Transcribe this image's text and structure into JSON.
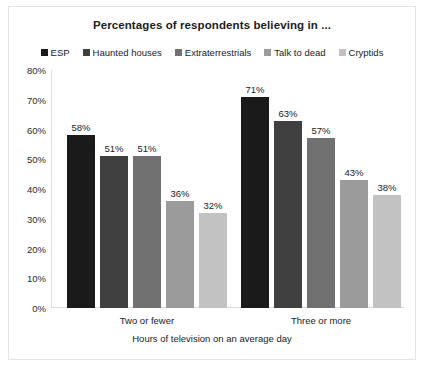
{
  "chart_data": {
    "type": "bar",
    "title": "Percentages of respondents believing in ...",
    "xlabel": "Hours of television on an average day",
    "ylabel": "",
    "ylim": [
      0,
      80
    ],
    "ytick_labels": [
      "80%",
      "70%",
      "60%",
      "50%",
      "40%",
      "30%",
      "20%",
      "10%",
      "0%"
    ],
    "ytick_values": [
      80,
      70,
      60,
      50,
      40,
      30,
      20,
      10,
      0
    ],
    "grid": false,
    "legend_position": "top",
    "value_suffix": "%",
    "categories": [
      "Two or fewer",
      "Three or more"
    ],
    "series": [
      {
        "name": "ESP",
        "color": "#1a1a1a",
        "values": [
          58,
          71
        ],
        "labels": [
          "58%",
          "71%"
        ]
      },
      {
        "name": "Haunted houses",
        "color": "#404040",
        "values": [
          51,
          63
        ],
        "labels": [
          "51%",
          "63%"
        ]
      },
      {
        "name": "Extraterrestrials",
        "color": "#717171",
        "values": [
          51,
          57
        ],
        "labels": [
          "51%",
          "57%"
        ]
      },
      {
        "name": "Talk to dead",
        "color": "#9b9b9b",
        "values": [
          36,
          43
        ],
        "labels": [
          "36%",
          "43%"
        ]
      },
      {
        "name": "Cryptids",
        "color": "#c2c2c2",
        "values": [
          32,
          38
        ],
        "labels": [
          "32%",
          "38%"
        ]
      }
    ]
  }
}
